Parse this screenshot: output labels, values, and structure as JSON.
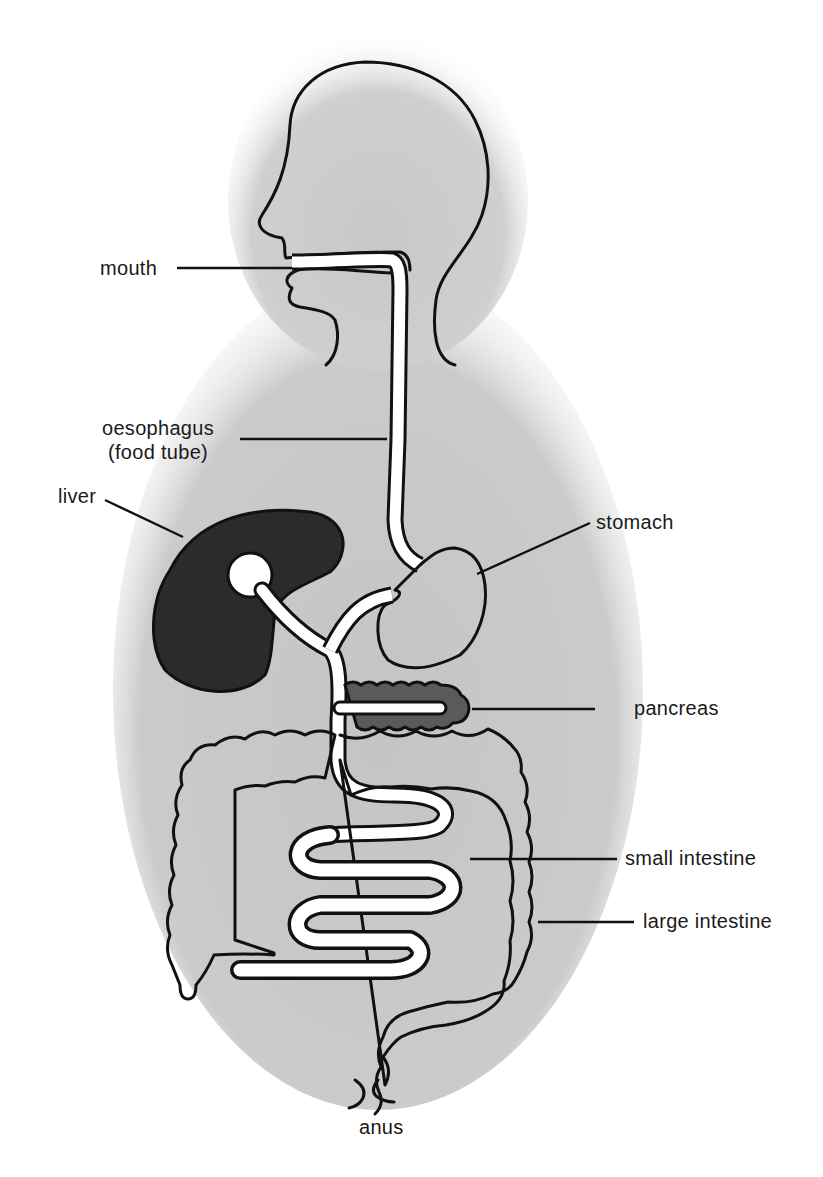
{
  "colors": {
    "background": "#ffffff",
    "body_shading": "#c9c9c9",
    "outline": "#111111",
    "liver": "#2b2b2b",
    "pancreas": "#5a5a5a",
    "tube": "#ffffff"
  },
  "labels": {
    "mouth": "mouth",
    "oesophagus_line1": "oesophagus",
    "oesophagus_line2": "(food tube)",
    "liver": "liver",
    "stomach": "stomach",
    "pancreas": "pancreas",
    "small_intestine": "small intestine",
    "large_intestine": "large intestine",
    "anus": "anus"
  }
}
